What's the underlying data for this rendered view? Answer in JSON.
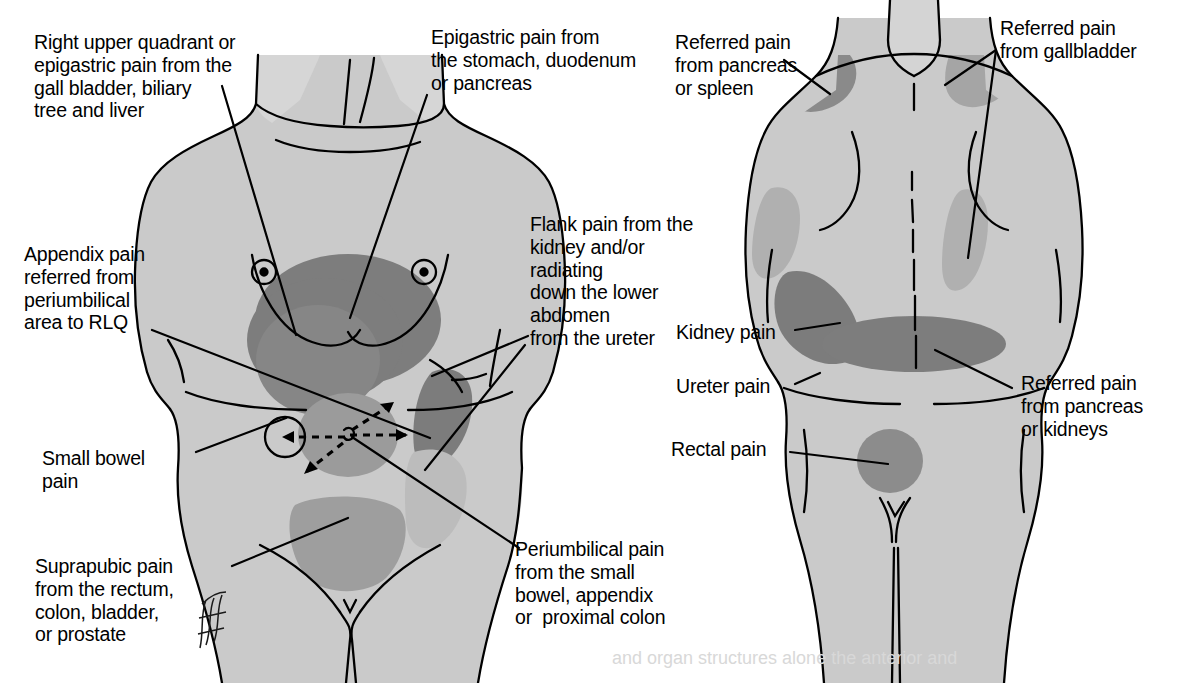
{
  "diagram": {
    "views": [
      {
        "name": "anterior-view",
        "label": "Anterior body view"
      },
      {
        "name": "posterior-view",
        "label": "Posterior body view"
      }
    ],
    "colors": {
      "body_fill": "#c9c9c9",
      "body_fill_light": "#d8d8d8",
      "pain_dark": "#7e7e7e",
      "pain_mid": "#9a9a9a",
      "outline": "#000000",
      "background": "#ffffff"
    }
  },
  "labels": {
    "anterior": {
      "ruq": "Right upper quadrant or\nepigastric pain from the\ngall bladder, biliary\ntree and liver",
      "epigastric": "Epigastric pain from\nthe stomach, duodenum\nor pancreas",
      "appendix": "Appendix pain\nreferred from\nperiumbilical\narea to RLQ",
      "flank": "Flank pain from the\nkidney and/or\nradiating\ndown the lower\nabdomen\nfrom the ureter",
      "small_bowel": "Small bowel\npain",
      "suprapubic": "Suprapubic pain\nfrom the rectum,\ncolon, bladder,\nor prostate",
      "periumbilical": "Periumbilical pain\nfrom the small\nbowel, appendix\nor  proximal colon"
    },
    "posterior": {
      "pancreas_spleen": "Referred pain\nfrom pancreas\nor spleen",
      "gallbladder": "Referred pain\nfrom gallbladder",
      "kidney": "Kidney pain",
      "ureter": "Ureter pain",
      "rectal": "Rectal pain",
      "pancreas_kidneys": "Referred pain\nfrom pancreas\nor kidneys"
    }
  },
  "footer": {
    "cutoff_text": "and organ structures alone the anterior and"
  },
  "signature": {
    "artist_mark": "artist signature"
  },
  "pain_regions": {
    "anterior": [
      {
        "name": "epigastric-region",
        "shade": "dark"
      },
      {
        "name": "periumbilical-region",
        "shade": "mid"
      },
      {
        "name": "suprapubic-region",
        "shade": "mid"
      },
      {
        "name": "left-flank-region",
        "shade": "dark"
      },
      {
        "name": "right-flank-region",
        "shade": "light"
      }
    ],
    "posterior": [
      {
        "name": "left-shoulder-region",
        "shade": "dark"
      },
      {
        "name": "right-shoulder-region",
        "shade": "mid"
      },
      {
        "name": "left-scapula-region",
        "shade": "mid"
      },
      {
        "name": "right-subscapular-region",
        "shade": "mid"
      },
      {
        "name": "left-flank-band-region",
        "shade": "dark"
      },
      {
        "name": "lower-back-band-region",
        "shade": "dark"
      },
      {
        "name": "sacral-rectal-region",
        "shade": "dark"
      }
    ]
  }
}
